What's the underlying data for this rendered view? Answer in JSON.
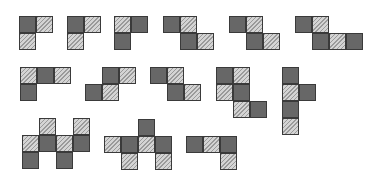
{
  "legend": {
    "dark": "dark-square",
    "hatch": "hatched-square"
  },
  "shapes": [
    {
      "name": "shape-r1-1",
      "cells": [
        [
          0,
          0,
          "dark"
        ],
        [
          1,
          0,
          "hatch"
        ],
        [
          0,
          1,
          "hatch"
        ]
      ]
    },
    {
      "name": "shape-r1-2",
      "cells": [
        [
          0,
          0,
          "dark"
        ],
        [
          1,
          0,
          "hatch"
        ],
        [
          0,
          1,
          "hatch"
        ]
      ]
    },
    {
      "name": "shape-r1-3",
      "cells": [
        [
          0,
          0,
          "hatch"
        ],
        [
          1,
          0,
          "dark"
        ],
        [
          0,
          1,
          "dark"
        ]
      ]
    },
    {
      "name": "shape-r1-4",
      "cells": [
        [
          0,
          0,
          "dark"
        ],
        [
          1,
          0,
          "hatch"
        ],
        [
          1,
          1,
          "dark"
        ],
        [
          2,
          1,
          "hatch"
        ]
      ]
    },
    {
      "name": "shape-r1-5",
      "cells": [
        [
          0,
          0,
          "dark"
        ],
        [
          1,
          0,
          "hatch"
        ],
        [
          1,
          1,
          "dark"
        ],
        [
          2,
          1,
          "hatch"
        ]
      ]
    },
    {
      "name": "shape-r1-6",
      "cells": [
        [
          0,
          0,
          "dark"
        ],
        [
          1,
          0,
          "hatch"
        ],
        [
          1,
          1,
          "dark"
        ],
        [
          2,
          1,
          "hatch"
        ],
        [
          3,
          1,
          "dark"
        ]
      ]
    },
    {
      "name": "shape-r2-1",
      "cells": [
        [
          0,
          0,
          "hatch"
        ],
        [
          1,
          0,
          "dark"
        ],
        [
          2,
          0,
          "hatch"
        ],
        [
          0,
          1,
          "dark"
        ]
      ]
    },
    {
      "name": "shape-r2-2",
      "cells": [
        [
          1,
          0,
          "dark"
        ],
        [
          2,
          0,
          "hatch"
        ],
        [
          0,
          1,
          "dark"
        ],
        [
          1,
          1,
          "hatch"
        ]
      ]
    },
    {
      "name": "shape-r2-3",
      "cells": [
        [
          0,
          0,
          "dark"
        ],
        [
          1,
          0,
          "hatch"
        ],
        [
          1,
          1,
          "dark"
        ],
        [
          2,
          1,
          "hatch"
        ]
      ]
    },
    {
      "name": "shape-r2-4",
      "cells": [
        [
          0,
          0,
          "dark"
        ],
        [
          1,
          0,
          "hatch"
        ],
        [
          0,
          1,
          "hatch"
        ],
        [
          1,
          1,
          "dark"
        ],
        [
          1,
          2,
          "hatch"
        ],
        [
          2,
          2,
          "dark"
        ]
      ]
    },
    {
      "name": "shape-r2-5",
      "cells": [
        [
          0,
          0,
          "dark"
        ],
        [
          0,
          1,
          "hatch"
        ],
        [
          1,
          1,
          "dark"
        ],
        [
          0,
          2,
          "dark"
        ],
        [
          0,
          3,
          "hatch"
        ]
      ]
    },
    {
      "name": "shape-r3-1",
      "cells": [
        [
          1,
          0,
          "hatch"
        ],
        [
          3,
          0,
          "hatch"
        ],
        [
          0,
          1,
          "hatch"
        ],
        [
          1,
          1,
          "dark"
        ],
        [
          2,
          1,
          "hatch"
        ],
        [
          3,
          1,
          "dark"
        ],
        [
          0,
          2,
          "dark"
        ],
        [
          2,
          2,
          "dark"
        ]
      ]
    },
    {
      "name": "shape-r3-2",
      "cells": [
        [
          2,
          0,
          "dark"
        ],
        [
          0,
          1,
          "hatch"
        ],
        [
          1,
          1,
          "dark"
        ],
        [
          2,
          1,
          "hatch"
        ],
        [
          3,
          1,
          "dark"
        ],
        [
          1,
          2,
          "hatch"
        ],
        [
          3,
          2,
          "hatch"
        ]
      ]
    },
    {
      "name": "shape-r3-3",
      "cells": [
        [
          0,
          0,
          "dark"
        ],
        [
          1,
          0,
          "hatch"
        ],
        [
          2,
          0,
          "dark"
        ],
        [
          2,
          1,
          "hatch"
        ]
      ]
    }
  ]
}
